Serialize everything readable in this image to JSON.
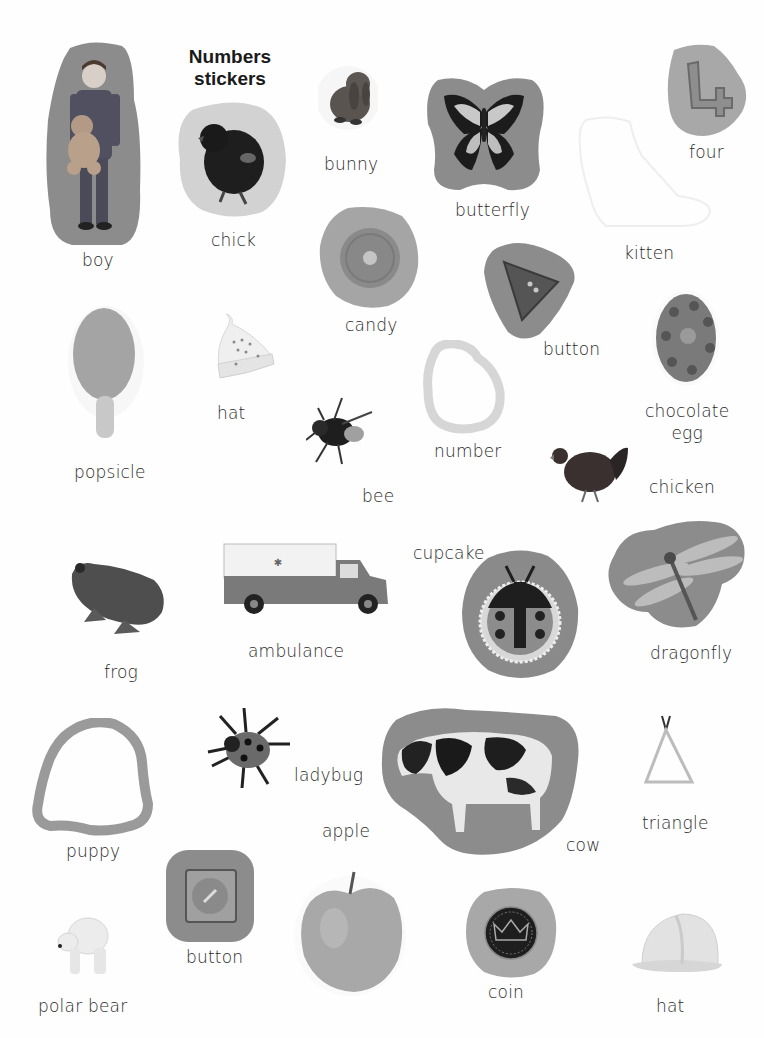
{
  "title": {
    "line1": "Numbers",
    "line2": "stickers"
  },
  "colors": {
    "sticker_dark": "#8a8a8a",
    "sticker_mid": "#a5a5a5",
    "sticker_light": "#d4d4d4",
    "outline_faint": "#ececec",
    "text": "#2a2a2a"
  },
  "stickers": [
    {
      "id": "boy",
      "label": "boy"
    },
    {
      "id": "chick",
      "label": "chick"
    },
    {
      "id": "bunny",
      "label": "bunny"
    },
    {
      "id": "butterfly",
      "label": "butterfly"
    },
    {
      "id": "four",
      "label": "four"
    },
    {
      "id": "kitten",
      "label": "kitten"
    },
    {
      "id": "candy",
      "label": "candy"
    },
    {
      "id": "button-triangle",
      "label": "button"
    },
    {
      "id": "popsicle",
      "label": "popsicle"
    },
    {
      "id": "hat-knit",
      "label": "hat"
    },
    {
      "id": "number",
      "label": "number"
    },
    {
      "id": "chocolate-egg",
      "label_line1": "chocolate",
      "label_line2": "egg"
    },
    {
      "id": "bee",
      "label": "bee"
    },
    {
      "id": "chicken",
      "label": "chicken"
    },
    {
      "id": "frog",
      "label": "frog"
    },
    {
      "id": "ambulance",
      "label": "ambulance"
    },
    {
      "id": "cupcake",
      "label": "cupcake"
    },
    {
      "id": "dragonfly",
      "label": "dragonfly"
    },
    {
      "id": "puppy",
      "label": "puppy"
    },
    {
      "id": "ladybug",
      "label": "ladybug"
    },
    {
      "id": "apple",
      "label": "apple"
    },
    {
      "id": "cow",
      "label": "cow"
    },
    {
      "id": "triangle",
      "label": "triangle"
    },
    {
      "id": "button-square",
      "label": "button"
    },
    {
      "id": "polar-bear",
      "label": "polar bear"
    },
    {
      "id": "coin",
      "label": "coin"
    },
    {
      "id": "hard-hat",
      "label": "hat"
    }
  ]
}
